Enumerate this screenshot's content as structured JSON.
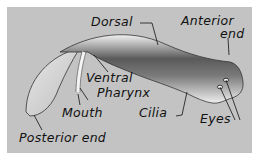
{
  "diagram": {
    "labels": {
      "dorsal": "Dorsal",
      "anterior_line1": "Anterior",
      "anterior_line2": "end",
      "ventral": "Ventral",
      "pharynx": "Pharynx",
      "mouth": "Mouth",
      "cilia": "Cilia",
      "eyes": "Eyes",
      "posterior": "Posterior end"
    },
    "colors": {
      "background": "#c3c3c3",
      "border": "#ffffff",
      "body_light": "#ededed",
      "body_dark": "#4a4a4a",
      "ink": "#111111"
    }
  }
}
